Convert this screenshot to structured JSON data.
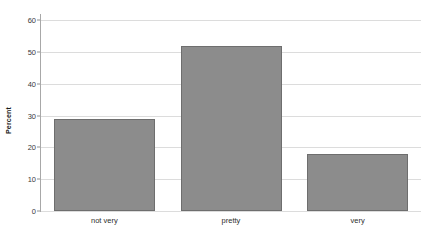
{
  "chart_data": {
    "type": "bar",
    "title": "",
    "xlabel": "",
    "ylabel": "Percent",
    "categories": [
      "not very",
      "pretty",
      "very"
    ],
    "values": [
      29,
      52,
      18
    ],
    "ylim": [
      0,
      62
    ],
    "yticks": [
      0,
      10,
      20,
      30,
      40,
      50,
      60
    ],
    "ytick_labels": [
      "0",
      "10",
      "20",
      "30",
      "40",
      "50",
      "60"
    ],
    "grid": true,
    "grid_axis": "y",
    "legend": false,
    "legend_position": "none",
    "colors": {
      "bar_fill": "#8c8c8c",
      "bar_border": "#6e6e6e",
      "gridline": "#dcdcdc",
      "axis": "#a8a8a8",
      "background": "#ffffff",
      "tick_text": "#3a3a3a"
    }
  }
}
